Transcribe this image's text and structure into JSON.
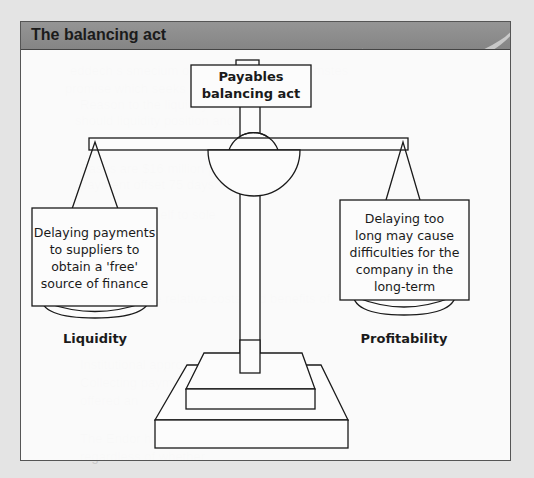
{
  "panel": {
    "title": "The balancing act"
  },
  "diagram": {
    "center_box": {
      "line1": "Payables",
      "line2": "balancing act"
    },
    "left_pan": {
      "lines": [
        "Delaying payments",
        "to suppliers to",
        "obtain a 'free'",
        "source of finance"
      ],
      "label": "Liquidity"
    },
    "right_pan": {
      "lines": [
        "Delaying too",
        "long may cause",
        "difficulties for the",
        "company in the",
        "long-term"
      ],
      "label": "Profitability"
    }
  },
  "colors": {
    "header_bg": "#8a8a8a",
    "line": "#1a1a1a",
    "page_bg": "#e4e4e4",
    "panel_bg": "#fcfcfc"
  }
}
